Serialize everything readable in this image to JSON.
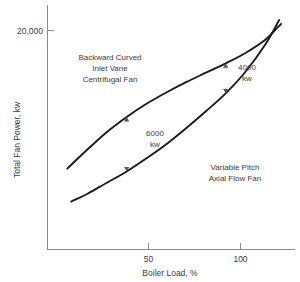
{
  "chart_data": {
    "type": "line",
    "title": "",
    "xlabel": "Boiler Load, %",
    "ylabel": "Total Fan Power, kw",
    "xlim": [
      10,
      135
    ],
    "ylim": [
      0,
      26000
    ],
    "grid": false,
    "legend_position": "inline-annotations",
    "xticks": [
      {
        "value": 50,
        "label": "50"
      },
      {
        "value": 100,
        "label": "100"
      }
    ],
    "yticks": [
      {
        "value": 20000,
        "label": "20,000"
      }
    ],
    "series": [
      {
        "name": "Backward Curved Inlet Vane Centrifugal Fan",
        "label_lines": [
          "Backward Curved",
          "Inlet Vane",
          "Centrifugal Fan"
        ],
        "x": [
          20,
          30,
          40,
          50,
          60,
          70,
          80,
          90,
          100,
          110,
          120,
          128
        ],
        "y": [
          8600,
          10600,
          12500,
          14100,
          15500,
          16700,
          17800,
          18800,
          19800,
          20900,
          22300,
          24000
        ]
      },
      {
        "name": "Variable Pitch Axial Flow Fan",
        "label_lines": [
          "Variable Pitch",
          "Axial Flow Fan"
        ],
        "x": [
          22,
          30,
          40,
          50,
          60,
          70,
          80,
          90,
          100,
          110,
          120,
          127
        ],
        "y": [
          5100,
          5900,
          7100,
          8300,
          9700,
          11200,
          12900,
          14700,
          16600,
          18900,
          21800,
          24400
        ]
      }
    ],
    "annotations": [
      {
        "id": "gap-50",
        "label_lines": [
          "6000",
          "kw"
        ],
        "at_x": 50,
        "from_y": 14100,
        "to_y": 8300,
        "value_kw": 6000,
        "arrow": "double"
      },
      {
        "id": "gap-100",
        "label_lines": [
          "4000",
          "kw"
        ],
        "at_x": 100,
        "from_y": 19800,
        "to_y": 16600,
        "value_kw": 4000,
        "arrow": "double"
      }
    ],
    "colors": {
      "curve": "#1a1a1a",
      "axis": "#8a8a8a",
      "text": "#3a3a3a",
      "annotation": "#5a5a5a",
      "background": "#ffffff"
    }
  }
}
